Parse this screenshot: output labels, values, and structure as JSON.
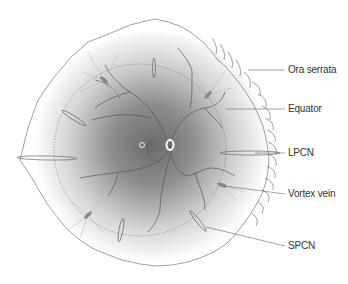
{
  "diagram": {
    "labels": {
      "ora_serrata": "Ora serrata",
      "equator": "Equator",
      "lpcn": "LPCN",
      "vortex_vein": "Vortex vein",
      "spcn": "SPCN"
    },
    "colors": {
      "line": "#777777",
      "label_text": "#333333",
      "fundus_center": "#6e6e6e",
      "background": "#ffffff"
    }
  }
}
